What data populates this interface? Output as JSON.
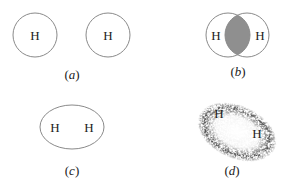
{
  "diagram": {
    "panels": [
      {
        "id": "a",
        "caption_open": "(",
        "caption_letter": "a",
        "caption_close": ")",
        "atoms": [
          "H",
          "H"
        ],
        "description": "Two separate hydrogen atoms"
      },
      {
        "id": "b",
        "caption_open": "(",
        "caption_letter": "b",
        "caption_close": ")",
        "atoms": [
          "H",
          "H"
        ],
        "description": "Overlapping atomic orbitals with shaded overlap region"
      },
      {
        "id": "c",
        "caption_open": "(",
        "caption_letter": "c",
        "caption_close": ")",
        "atoms": [
          "H",
          "H"
        ],
        "description": "Molecular orbital enclosing both nuclei"
      },
      {
        "id": "d",
        "caption_open": "(",
        "caption_letter": "d",
        "caption_close": ")",
        "atoms": [
          "H",
          "H"
        ],
        "description": "Electron density cloud around H2 molecule"
      }
    ],
    "colors": {
      "outline": "#8a8a8a",
      "overlap_fill": "#8f8f8f",
      "cloud_dots": "#6e6e6e",
      "text": "#222222"
    }
  }
}
